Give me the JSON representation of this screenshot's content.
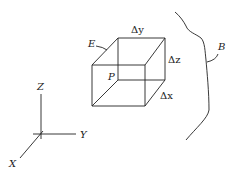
{
  "diagram": {
    "labels": {
      "element": "E",
      "boundary": "B",
      "point": "P",
      "dy": "Δy",
      "dz": "Δz",
      "dx": "Δx"
    },
    "axes": {
      "x": "X",
      "y": "Y",
      "z": "Z"
    },
    "colors": {
      "stroke": "#222222",
      "background": "#ffffff"
    }
  }
}
